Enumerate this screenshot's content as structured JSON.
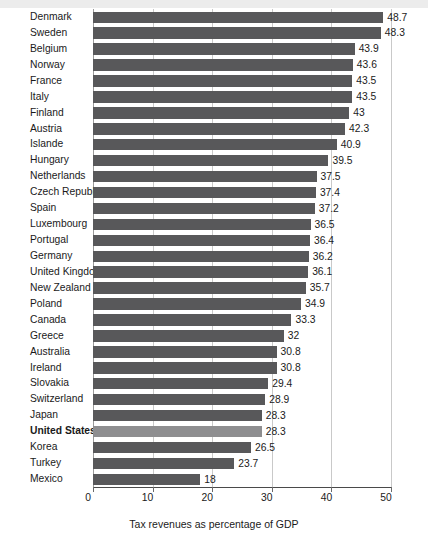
{
  "chart_data": {
    "type": "bar",
    "orientation": "horizontal",
    "title": "",
    "xlabel": "Tax revenues as percentage of GDP",
    "ylabel": "",
    "xlim": [
      0,
      50
    ],
    "xticks": [
      0,
      10,
      20,
      30,
      40,
      50
    ],
    "xtick_labels": [
      "0",
      "10",
      "20",
      "30",
      "40",
      "50"
    ],
    "grid": true,
    "legend": null,
    "highlight_category": "United States",
    "colors": {
      "bar": "#58585a",
      "bar_highlight": "#8e8e90",
      "grid": "#c9c9c9",
      "axis": "#4a4a4a",
      "text": "#1a1a1a",
      "background": "#ffffff",
      "top_band": "#ececec"
    },
    "categories": [
      "Denmark",
      "Sweden",
      "Belgium",
      "Norway",
      "France",
      "Italy",
      "Finland",
      "Austria",
      "Islande",
      "Hungary",
      "Netherlands",
      "Czech Republic",
      "Spain",
      "Luxembourg",
      "Portugal",
      "Germany",
      "United Kingdom",
      "New Zealand",
      "Poland",
      "Canada",
      "Greece",
      "Australia",
      "Ireland",
      "Slovakia",
      "Switzerland",
      "Japan",
      "United States",
      "Korea",
      "Turkey",
      "Mexico"
    ],
    "values": [
      48.7,
      48.3,
      43.9,
      43.6,
      43.5,
      43.5,
      43,
      42.3,
      40.9,
      39.5,
      37.5,
      37.4,
      37.2,
      36.5,
      36.4,
      36.2,
      36.1,
      35.7,
      34.9,
      33.3,
      32,
      30.8,
      30.8,
      29.4,
      28.9,
      28.3,
      28.3,
      26.5,
      23.7,
      18
    ],
    "value_labels": [
      "48.7",
      "48.3",
      "43.9",
      "43.6",
      "43.5",
      "43.5",
      "43",
      "42.3",
      "40.9",
      "39.5",
      "37.5",
      "37.4",
      "37.2",
      "36.5",
      "36.4",
      "36.2",
      "36.1",
      "35.7",
      "34.9",
      "33.3",
      "32",
      "30.8",
      "30.8",
      "29.4",
      "28.9",
      "28.3",
      "28.3",
      "26.5",
      "23.7",
      "18"
    ]
  }
}
